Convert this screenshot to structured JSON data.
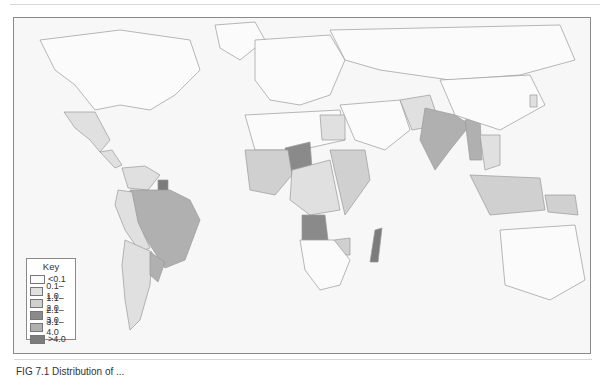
{
  "map": {
    "type": "choropleth-world",
    "legend": {
      "title": "Key",
      "classes": [
        {
          "label": "<0.1",
          "color": "#fbfbfb"
        },
        {
          "label": "0.1–1.0",
          "color": "#e0e0e0"
        },
        {
          "label": "1.1–2.0",
          "color": "#d0d0d0"
        },
        {
          "label": "2.1–3.0",
          "color": "#8a8a8a"
        },
        {
          "label": "3.1–4.0",
          "color": "#b0b0b0"
        },
        {
          "label": ">4.0",
          "color": "#7c7c7c"
        }
      ]
    },
    "regions": [
      {
        "name": "North America",
        "class": 0
      },
      {
        "name": "Greenland",
        "class": 0
      },
      {
        "name": "Mexico",
        "class": 1
      },
      {
        "name": "Central America",
        "class": 1
      },
      {
        "name": "Colombia / Venezuela",
        "class": 1
      },
      {
        "name": "Suriname",
        "class": 5
      },
      {
        "name": "Brazil",
        "class": 4
      },
      {
        "name": "Peru / Bolivia",
        "class": 1
      },
      {
        "name": "Argentina / Chile",
        "class": 1
      },
      {
        "name": "Paraguay",
        "class": 4
      },
      {
        "name": "Europe",
        "class": 0
      },
      {
        "name": "Russia / Northern Asia",
        "class": 0
      },
      {
        "name": "North Africa",
        "class": 0
      },
      {
        "name": "Egypt",
        "class": 1
      },
      {
        "name": "Niger",
        "class": 3
      },
      {
        "name": "West Africa",
        "class": 2
      },
      {
        "name": "Central Africa",
        "class": 1
      },
      {
        "name": "East Africa",
        "class": 2
      },
      {
        "name": "Angola",
        "class": 3
      },
      {
        "name": "Zimbabwe",
        "class": 2
      },
      {
        "name": "Southern Africa",
        "class": 0
      },
      {
        "name": "Madagascar",
        "class": 5
      },
      {
        "name": "Middle East",
        "class": 0
      },
      {
        "name": "Afghanistan / Pakistan",
        "class": 1
      },
      {
        "name": "India",
        "class": 4
      },
      {
        "name": "Myanmar",
        "class": 4
      },
      {
        "name": "Indochina",
        "class": 1
      },
      {
        "name": "China",
        "class": 0
      },
      {
        "name": "Korea",
        "class": 1
      },
      {
        "name": "Indonesia",
        "class": 2
      },
      {
        "name": "Papua New Guinea",
        "class": 2
      },
      {
        "name": "Australia",
        "class": 0
      }
    ]
  },
  "caption": "FIG 7.1  Distribution of ..."
}
